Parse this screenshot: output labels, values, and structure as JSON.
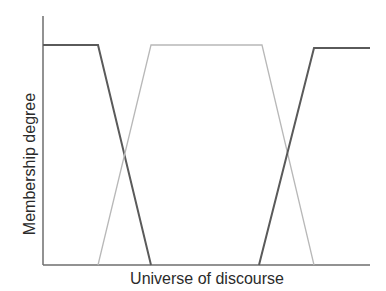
{
  "diagram": {
    "title": "",
    "x_axis_label": "Universe of discourse",
    "y_axis_label": "Membership degree",
    "colors": {
      "axis": "#6e6e6e",
      "dark_series": "#5a5a5a",
      "light_series": "#b8b8b8",
      "text": "#2b2b2b"
    },
    "series": [
      {
        "name": "left-shoulder (dark)",
        "shade": "dark",
        "points": [
          [
            43,
            45
          ],
          [
            98,
            45
          ],
          [
            151,
            265
          ]
        ]
      },
      {
        "name": "middle trapezoid (light)",
        "shade": "light",
        "points": [
          [
            98,
            265
          ],
          [
            151,
            45
          ],
          [
            262,
            45
          ],
          [
            314,
            265
          ]
        ]
      },
      {
        "name": "right-shoulder (dark)",
        "shade": "dark",
        "points": [
          [
            259,
            265
          ],
          [
            314,
            48
          ],
          [
            370,
            48
          ]
        ]
      }
    ]
  }
}
